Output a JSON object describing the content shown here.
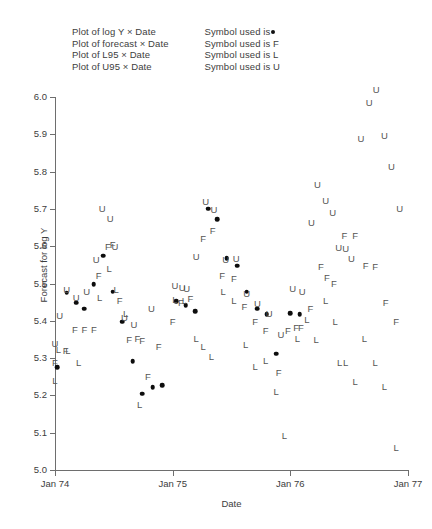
{
  "legend": {
    "series_lines": [
      "Plot of log Y × Date",
      "Plot of forecast × Date",
      "Plot of L95 × Date",
      "Plot of U95 × Date"
    ],
    "symbol_lines": [
      "Symbol used is",
      "Symbol used is F",
      "Symbol used is L",
      "Symbol used is U"
    ]
  },
  "axes": {
    "y_title": "Forecast for log Y",
    "x_title": "Date",
    "y_ticks": [
      "5.0",
      "5.1",
      "5.2",
      "5.3",
      "5.4",
      "5.5",
      "5.6",
      "5.7",
      "5.8",
      "5.9",
      "6.0"
    ],
    "x_ticks": [
      "Jan 74",
      "Jan 75",
      "Jan 76",
      "Jan 77"
    ],
    "ylim": [
      5.0,
      6.0
    ],
    "xlim": [
      1974.0,
      1977.0
    ]
  },
  "chart_data": {
    "type": "scatter",
    "title": "",
    "xlabel": "Date",
    "ylabel": "Forecast for log Y",
    "ylim": [
      5.0,
      6.0
    ],
    "xlim": [
      1974.0,
      1977.0
    ],
    "grid": false,
    "legend_position": "top",
    "x_tick_values": [
      1974.0,
      1975.0,
      1976.0,
      1977.0
    ],
    "x_tick_labels": [
      "Jan 74",
      "Jan 75",
      "Jan 76",
      "Jan 77"
    ],
    "y_tick_values": [
      5.0,
      5.1,
      5.2,
      5.3,
      5.4,
      5.5,
      5.6,
      5.7,
      5.8,
      5.9,
      6.0
    ],
    "series": [
      {
        "name": "log Y",
        "symbol": "dot",
        "points": [
          {
            "x": 1974.02,
            "y": 5.275
          },
          {
            "x": 1974.1,
            "y": 5.475
          },
          {
            "x": 1974.18,
            "y": 5.448
          },
          {
            "x": 1974.25,
            "y": 5.432
          },
          {
            "x": 1974.33,
            "y": 5.498
          },
          {
            "x": 1974.41,
            "y": 5.575
          },
          {
            "x": 1974.49,
            "y": 5.478
          },
          {
            "x": 1974.57,
            "y": 5.398
          },
          {
            "x": 1974.66,
            "y": 5.292
          },
          {
            "x": 1974.74,
            "y": 5.205
          },
          {
            "x": 1974.83,
            "y": 5.222
          },
          {
            "x": 1974.91,
            "y": 5.228
          },
          {
            "x": 1975.03,
            "y": 5.452
          },
          {
            "x": 1975.11,
            "y": 5.442
          },
          {
            "x": 1975.19,
            "y": 5.425
          },
          {
            "x": 1975.3,
            "y": 5.7
          },
          {
            "x": 1975.38,
            "y": 5.672
          },
          {
            "x": 1975.46,
            "y": 5.568
          },
          {
            "x": 1975.55,
            "y": 5.548
          },
          {
            "x": 1975.63,
            "y": 5.478
          },
          {
            "x": 1975.72,
            "y": 5.432
          },
          {
            "x": 1975.8,
            "y": 5.418
          },
          {
            "x": 1975.88,
            "y": 5.312
          },
          {
            "x": 1976.0,
            "y": 5.42
          },
          {
            "x": 1976.08,
            "y": 5.418
          }
        ]
      },
      {
        "name": "forecast",
        "symbol": "F",
        "points": [
          {
            "x": 1974.0,
            "y": 5.288
          },
          {
            "x": 1974.09,
            "y": 5.318
          },
          {
            "x": 1974.17,
            "y": 5.375
          },
          {
            "x": 1974.25,
            "y": 5.375
          },
          {
            "x": 1974.33,
            "y": 5.375
          },
          {
            "x": 1974.37,
            "y": 5.52
          },
          {
            "x": 1974.45,
            "y": 5.598
          },
          {
            "x": 1974.49,
            "y": 5.602
          },
          {
            "x": 1974.55,
            "y": 5.452
          },
          {
            "x": 1974.63,
            "y": 5.348
          },
          {
            "x": 1974.7,
            "y": 5.352
          },
          {
            "x": 1974.74,
            "y": 5.345
          },
          {
            "x": 1974.79,
            "y": 5.248
          },
          {
            "x": 1974.88,
            "y": 5.33
          },
          {
            "x": 1975.0,
            "y": 5.398
          },
          {
            "x": 1975.07,
            "y": 5.448
          },
          {
            "x": 1975.15,
            "y": 5.458
          },
          {
            "x": 1975.26,
            "y": 5.618
          },
          {
            "x": 1975.34,
            "y": 5.64
          },
          {
            "x": 1975.42,
            "y": 5.52
          },
          {
            "x": 1975.52,
            "y": 5.512
          },
          {
            "x": 1975.61,
            "y": 5.438
          },
          {
            "x": 1975.7,
            "y": 5.398
          },
          {
            "x": 1975.79,
            "y": 5.372
          },
          {
            "x": 1975.9,
            "y": 5.26
          },
          {
            "x": 1975.98,
            "y": 5.372
          },
          {
            "x": 1976.05,
            "y": 5.382
          },
          {
            "x": 1976.09,
            "y": 5.382
          },
          {
            "x": 1976.17,
            "y": 5.432
          },
          {
            "x": 1976.26,
            "y": 5.545
          },
          {
            "x": 1976.31,
            "y": 5.515
          },
          {
            "x": 1976.37,
            "y": 5.498
          },
          {
            "x": 1976.46,
            "y": 5.628
          },
          {
            "x": 1976.55,
            "y": 5.628
          },
          {
            "x": 1976.64,
            "y": 5.548
          },
          {
            "x": 1976.72,
            "y": 5.545
          },
          {
            "x": 1976.81,
            "y": 5.448
          },
          {
            "x": 1976.9,
            "y": 5.398
          }
        ]
      },
      {
        "name": "L95",
        "symbol": "L",
        "points": [
          {
            "x": 1974.0,
            "y": 5.238
          },
          {
            "x": 1974.03,
            "y": 5.322
          },
          {
            "x": 1974.11,
            "y": 5.318
          },
          {
            "x": 1974.2,
            "y": 5.288
          },
          {
            "x": 1974.38,
            "y": 5.462
          },
          {
            "x": 1974.46,
            "y": 5.538
          },
          {
            "x": 1974.52,
            "y": 5.482
          },
          {
            "x": 1974.6,
            "y": 5.418
          },
          {
            "x": 1974.72,
            "y": 5.175
          },
          {
            "x": 1975.02,
            "y": 5.455
          },
          {
            "x": 1975.1,
            "y": 5.452
          },
          {
            "x": 1975.2,
            "y": 5.352
          },
          {
            "x": 1975.26,
            "y": 5.33
          },
          {
            "x": 1975.33,
            "y": 5.302
          },
          {
            "x": 1975.43,
            "y": 5.478
          },
          {
            "x": 1975.52,
            "y": 5.452
          },
          {
            "x": 1975.62,
            "y": 5.335
          },
          {
            "x": 1975.7,
            "y": 5.275
          },
          {
            "x": 1975.79,
            "y": 5.292
          },
          {
            "x": 1975.88,
            "y": 5.208
          },
          {
            "x": 1975.95,
            "y": 5.092
          },
          {
            "x": 1976.06,
            "y": 5.352
          },
          {
            "x": 1976.14,
            "y": 5.402
          },
          {
            "x": 1976.22,
            "y": 5.348
          },
          {
            "x": 1976.3,
            "y": 5.452
          },
          {
            "x": 1976.38,
            "y": 5.398
          },
          {
            "x": 1976.42,
            "y": 5.288
          },
          {
            "x": 1976.47,
            "y": 5.288
          },
          {
            "x": 1976.55,
            "y": 5.235
          },
          {
            "x": 1976.63,
            "y": 5.352
          },
          {
            "x": 1976.72,
            "y": 5.288
          },
          {
            "x": 1976.8,
            "y": 5.222
          },
          {
            "x": 1976.9,
            "y": 5.06
          }
        ]
      },
      {
        "name": "U95",
        "symbol": "U",
        "points": [
          {
            "x": 1974.0,
            "y": 5.338
          },
          {
            "x": 1974.04,
            "y": 5.412
          },
          {
            "x": 1974.1,
            "y": 5.482
          },
          {
            "x": 1974.18,
            "y": 5.462
          },
          {
            "x": 1974.27,
            "y": 5.478
          },
          {
            "x": 1974.35,
            "y": 5.562
          },
          {
            "x": 1974.4,
            "y": 5.7
          },
          {
            "x": 1974.47,
            "y": 5.672
          },
          {
            "x": 1974.51,
            "y": 5.598
          },
          {
            "x": 1974.59,
            "y": 5.408
          },
          {
            "x": 1974.67,
            "y": 5.388
          },
          {
            "x": 1974.82,
            "y": 5.432
          },
          {
            "x": 1975.02,
            "y": 5.492
          },
          {
            "x": 1975.08,
            "y": 5.488
          },
          {
            "x": 1975.12,
            "y": 5.485
          },
          {
            "x": 1975.2,
            "y": 5.57
          },
          {
            "x": 1975.28,
            "y": 5.718
          },
          {
            "x": 1975.35,
            "y": 5.698
          },
          {
            "x": 1975.45,
            "y": 5.562
          },
          {
            "x": 1975.54,
            "y": 5.565
          },
          {
            "x": 1975.63,
            "y": 5.472
          },
          {
            "x": 1975.72,
            "y": 5.445
          },
          {
            "x": 1975.82,
            "y": 5.418
          },
          {
            "x": 1975.92,
            "y": 5.362
          },
          {
            "x": 1976.02,
            "y": 5.485
          },
          {
            "x": 1976.1,
            "y": 5.478
          },
          {
            "x": 1976.18,
            "y": 5.662
          },
          {
            "x": 1976.23,
            "y": 5.765
          },
          {
            "x": 1976.3,
            "y": 5.722
          },
          {
            "x": 1976.36,
            "y": 5.69
          },
          {
            "x": 1976.41,
            "y": 5.595
          },
          {
            "x": 1976.47,
            "y": 5.592
          },
          {
            "x": 1976.52,
            "y": 5.565
          },
          {
            "x": 1976.6,
            "y": 5.888
          },
          {
            "x": 1976.67,
            "y": 5.985
          },
          {
            "x": 1976.73,
            "y": 6.018
          },
          {
            "x": 1976.8,
            "y": 5.895
          },
          {
            "x": 1976.86,
            "y": 5.812
          },
          {
            "x": 1976.93,
            "y": 5.7
          }
        ]
      }
    ]
  }
}
